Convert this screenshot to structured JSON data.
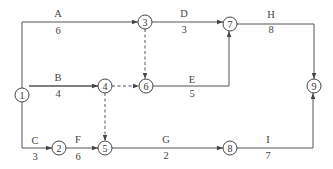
{
  "diagram": {
    "type": "activity-on-arrow network",
    "nodes": [
      {
        "id": "1",
        "label": "1",
        "x": 22,
        "y": 95
      },
      {
        "id": "2",
        "label": "2",
        "x": 59,
        "y": 148
      },
      {
        "id": "3",
        "label": "3",
        "x": 145,
        "y": 22
      },
      {
        "id": "4",
        "label": "4",
        "x": 105,
        "y": 86
      },
      {
        "id": "5",
        "label": "5",
        "x": 105,
        "y": 148
      },
      {
        "id": "6",
        "label": "6",
        "x": 146,
        "y": 86
      },
      {
        "id": "7",
        "label": "7",
        "x": 230,
        "y": 24
      },
      {
        "id": "8",
        "label": "8",
        "x": 230,
        "y": 148
      },
      {
        "id": "9",
        "label": "9",
        "x": 314,
        "y": 86
      }
    ],
    "activities": [
      {
        "name": "A",
        "duration": "6",
        "from": "1",
        "to": "3",
        "dummy": false
      },
      {
        "name": "B",
        "duration": "4",
        "from": "1",
        "to": "4",
        "dummy": false
      },
      {
        "name": "C",
        "duration": "3",
        "from": "1",
        "to": "2",
        "dummy": false
      },
      {
        "name": "D",
        "duration": "3",
        "from": "3",
        "to": "7",
        "dummy": false
      },
      {
        "name": "E",
        "duration": "5",
        "from": "6",
        "to": "7",
        "dummy": false
      },
      {
        "name": "F",
        "duration": "6",
        "from": "2",
        "to": "5",
        "dummy": false
      },
      {
        "name": "G",
        "duration": "2",
        "from": "5",
        "to": "8",
        "dummy": false
      },
      {
        "name": "H",
        "duration": "8",
        "from": "7",
        "to": "9",
        "dummy": false
      },
      {
        "name": "I",
        "duration": "7",
        "from": "8",
        "to": "9",
        "dummy": false
      },
      {
        "name": "",
        "duration": "",
        "from": "3",
        "to": "6",
        "dummy": true
      },
      {
        "name": "",
        "duration": "",
        "from": "4",
        "to": "6",
        "dummy": true
      },
      {
        "name": "",
        "duration": "",
        "from": "4",
        "to": "5",
        "dummy": true
      }
    ]
  },
  "labels": {
    "A": {
      "name": "A",
      "duration": "6"
    },
    "B": {
      "name": "B",
      "duration": "4"
    },
    "C": {
      "name": "C",
      "duration": "3"
    },
    "D": {
      "name": "D",
      "duration": "3"
    },
    "E": {
      "name": "E",
      "duration": "5"
    },
    "F": {
      "name": "F",
      "duration": "6"
    },
    "G": {
      "name": "G",
      "duration": "2"
    },
    "H": {
      "name": "H",
      "duration": "8"
    },
    "I": {
      "name": "I",
      "duration": "7"
    }
  },
  "node_labels": {
    "n1": "1",
    "n2": "2",
    "n3": "3",
    "n4": "4",
    "n5": "5",
    "n6": "6",
    "n7": "7",
    "n8": "8",
    "n9": "9"
  }
}
